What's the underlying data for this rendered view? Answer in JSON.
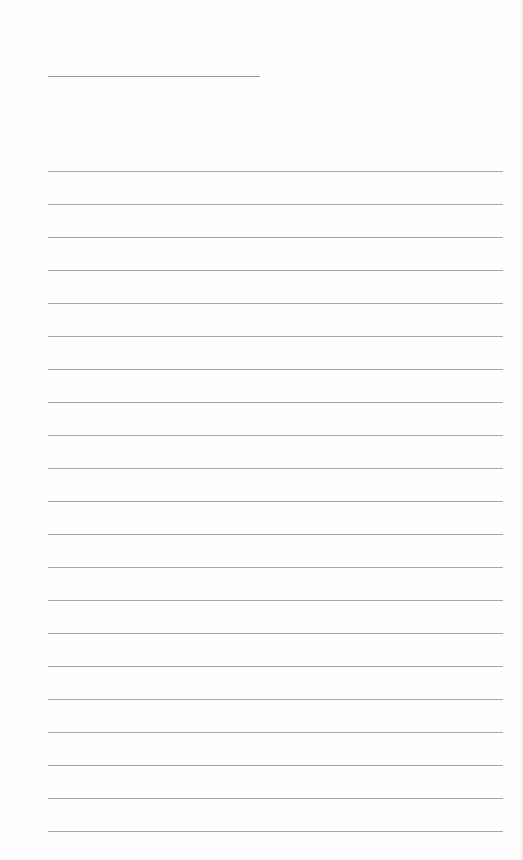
{
  "page": {
    "type": "blank lined paper",
    "title_line": {
      "visible": true
    },
    "rules": {
      "count": 21,
      "first_y": 171,
      "spacing": 33,
      "color": "#a6a6a6"
    }
  }
}
